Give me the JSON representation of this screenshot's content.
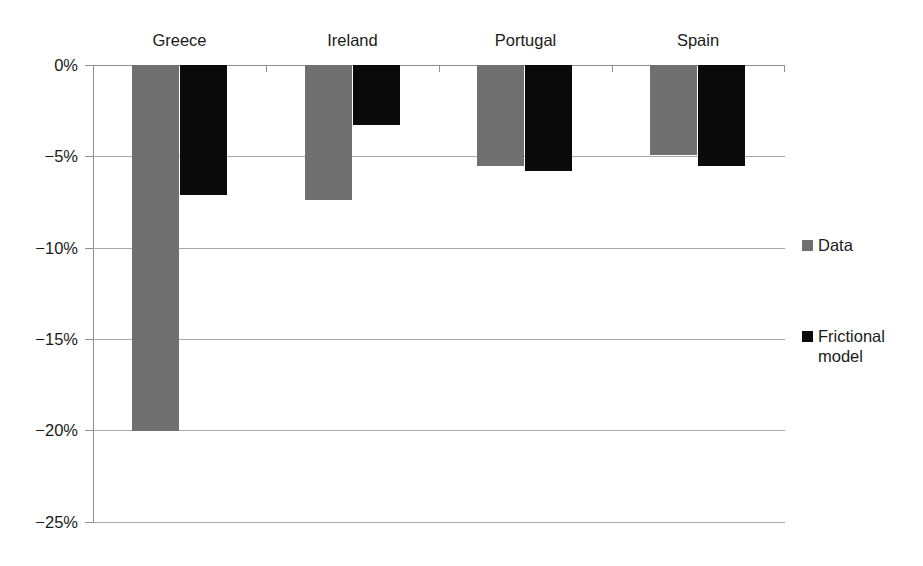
{
  "chart_data": {
    "type": "bar",
    "title": "",
    "subtitle": "",
    "xlabel": "",
    "ylabel": "",
    "categories": [
      "Greece",
      "Ireland",
      "Portugal",
      "Spain"
    ],
    "series": [
      {
        "name": "Data",
        "color": "#707070",
        "values": [
          -20.0,
          -7.4,
          -5.5,
          -4.9
        ]
      },
      {
        "name": "Frictional model",
        "color": "#0a0a0a",
        "values": [
          -7.1,
          -3.3,
          -5.8,
          -5.5
        ]
      }
    ],
    "ylim": [
      -25,
      0
    ],
    "ytick_values": [
      0,
      -5,
      -10,
      -15,
      -20,
      -25
    ],
    "ytick_labels": [
      "0%",
      "−5%",
      "−10%",
      "−15%",
      "−20%",
      "−25%"
    ],
    "grid": true,
    "grid_axis": "y",
    "legend_position": "right",
    "legend": [
      {
        "label": "Data",
        "color": "#707070"
      },
      {
        "label": "Frictional model",
        "color": "#0a0a0a"
      }
    ],
    "units": "percent",
    "orientation": "vertical",
    "bar_direction": "downward"
  }
}
